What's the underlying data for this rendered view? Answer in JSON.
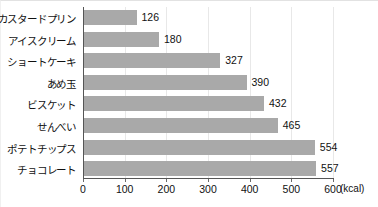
{
  "chart_data": {
    "type": "bar",
    "orientation": "horizontal",
    "title": "",
    "xlabel": "(kcal)",
    "ylabel": "",
    "xlim": [
      0,
      600
    ],
    "xticks": [
      0,
      100,
      200,
      300,
      400,
      500,
      600
    ],
    "grid": true,
    "legend": false,
    "bar_color": "#a9a9a9",
    "axis_color": "#555555",
    "gridline_color": "#e8e8e8",
    "categories": [
      "カスタードプリン",
      "アイスクリーム",
      "ショートケーキ",
      "あめ玉",
      "ビスケット",
      "せんべい",
      "ポテトチップス",
      "チョコレート"
    ],
    "values": [
      126,
      180,
      327,
      390,
      432,
      465,
      554,
      557
    ],
    "value_labels": [
      "126",
      "180",
      "327",
      "390",
      "432",
      "465",
      "554",
      "557"
    ],
    "tick_labels": [
      "0",
      "100",
      "200",
      "300",
      "400",
      "500",
      "600"
    ],
    "unit": "(kcal)"
  }
}
